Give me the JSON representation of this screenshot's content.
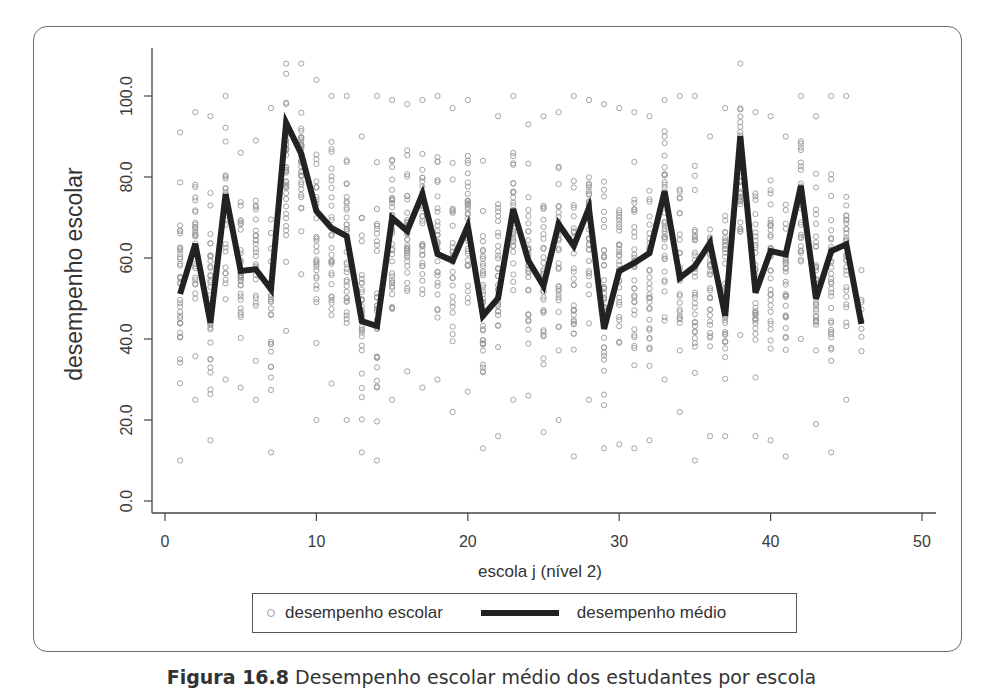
{
  "chart_data": {
    "type": "scatter+line",
    "title": "",
    "xlabel": "escola j (nível 2)",
    "ylabel": "desempenho escolar",
    "xlim": [
      0,
      50
    ],
    "ylim": [
      0,
      110
    ],
    "x_ticks": [
      0,
      10,
      20,
      30,
      40,
      50
    ],
    "x_tick_labels": [
      "0",
      "10",
      "20",
      "30",
      "40",
      "50"
    ],
    "y_ticks": [
      0,
      20,
      40,
      60,
      80,
      100
    ],
    "y_tick_labels": [
      "0.0",
      "20.0",
      "40.0",
      "60.0",
      "80.0",
      "100.0"
    ],
    "grid": false,
    "legend_position": "bottom",
    "legend": [
      {
        "label": "desempenho escolar",
        "marker": "circle",
        "color": "#999999"
      },
      {
        "label": "desempenho médio",
        "marker": "line",
        "color": "#222222"
      }
    ],
    "series": [
      {
        "name": "desempenho médio",
        "type": "line",
        "color": "#222222",
        "x": [
          1,
          2,
          3,
          4,
          5,
          6,
          7,
          8,
          9,
          10,
          11,
          12,
          13,
          14,
          15,
          16,
          17,
          18,
          19,
          20,
          21,
          22,
          23,
          24,
          25,
          26,
          27,
          28,
          29,
          30,
          31,
          32,
          33,
          34,
          35,
          36,
          37,
          38,
          39,
          40,
          41,
          42,
          43,
          44,
          45,
          46
        ],
        "values": [
          51.1,
          63.5,
          44.0,
          75.8,
          56.8,
          57.2,
          52.3,
          93.4,
          85.7,
          71.6,
          67.4,
          65.4,
          44.4,
          43.2,
          69.9,
          66.7,
          75.8,
          61.0,
          59.3,
          67.9,
          45.7,
          50.1,
          72.1,
          59.3,
          53.1,
          68.4,
          63.0,
          72.3,
          42.5,
          56.8,
          58.8,
          61.2,
          76.5,
          55.1,
          58.0,
          63.7,
          45.7,
          90.1,
          51.4,
          61.7,
          60.9,
          77.8,
          49.9,
          61.7,
          63.4,
          43.7
        ]
      },
      {
        "name": "desempenho escolar",
        "type": "scatter",
        "color": "#999999",
        "note": "Individual student scores per school (j = 1..46); approximate range per school",
        "ranges": [
          [
            10,
            91
          ],
          [
            25,
            96
          ],
          [
            15,
            95
          ],
          [
            30,
            100
          ],
          [
            28,
            86
          ],
          [
            25,
            89
          ],
          [
            12,
            97
          ],
          [
            42,
            108
          ],
          [
            56,
            108
          ],
          [
            20,
            104
          ],
          [
            29,
            100
          ],
          [
            20,
            100
          ],
          [
            12,
            90
          ],
          [
            10,
            100
          ],
          [
            25,
            99
          ],
          [
            32,
            98
          ],
          [
            28,
            99
          ],
          [
            30,
            100
          ],
          [
            22,
            97
          ],
          [
            27,
            99
          ],
          [
            13,
            84
          ],
          [
            16,
            95
          ],
          [
            25,
            100
          ],
          [
            26,
            93
          ],
          [
            17,
            95
          ],
          [
            20,
            96
          ],
          [
            11,
            100
          ],
          [
            25,
            99
          ],
          [
            13,
            98
          ],
          [
            14,
            97
          ],
          [
            13,
            96
          ],
          [
            15,
            95
          ],
          [
            30,
            99
          ],
          [
            22,
            100
          ],
          [
            10,
            100
          ],
          [
            16,
            90
          ],
          [
            16,
            97
          ],
          [
            41,
            108
          ],
          [
            16,
            96
          ],
          [
            15,
            95
          ],
          [
            11,
            90
          ],
          [
            40,
            100
          ],
          [
            19,
            95
          ],
          [
            12,
            100
          ],
          [
            25,
            100
          ],
          [
            37,
            57
          ]
        ],
        "counts": [
          36,
          30,
          34,
          26,
          32,
          28,
          26,
          40,
          38,
          30,
          30,
          34,
          32,
          30,
          36,
          34,
          32,
          30,
          32,
          34,
          38,
          30,
          34,
          32,
          32,
          30,
          32,
          32,
          36,
          32,
          34,
          34,
          36,
          30,
          34,
          32,
          34,
          38,
          34,
          34,
          30,
          32,
          34,
          34,
          30,
          8
        ]
      }
    ]
  },
  "caption": {
    "figure_number": "Figura 16.8",
    "text": " Desempenho escolar médio dos estudantes por escola"
  }
}
